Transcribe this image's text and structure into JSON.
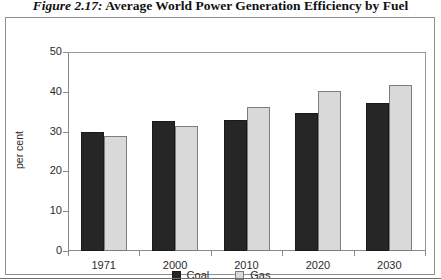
{
  "figure": {
    "number_label": "Figure 2.17:",
    "caption_text": "Average World Power Generation Efficiency by Fuel"
  },
  "chart_data": {
    "type": "bar",
    "title": "Average World Power Generation Efficiency by Fuel",
    "xlabel": "",
    "ylabel": "per cent",
    "categories": [
      "1971",
      "2000",
      "2010",
      "2020",
      "2030"
    ],
    "series": [
      {
        "name": "Coal",
        "color": "#262626",
        "values": [
          30.0,
          32.7,
          32.9,
          34.6,
          37.2
        ]
      },
      {
        "name": "Gas",
        "color": "#d9d9d9",
        "values": [
          28.8,
          31.4,
          36.2,
          40.3,
          41.7
        ]
      }
    ],
    "ylim": [
      0,
      50
    ],
    "yticks": [
      0,
      10,
      20,
      30,
      40,
      50
    ],
    "ytick_labels": [
      "0",
      "10",
      "20",
      "30",
      "40",
      "50"
    ],
    "grid": false,
    "legend_position": "bottom-center"
  },
  "legend": {
    "items": [
      {
        "label": "Coal"
      },
      {
        "label": "Gas"
      }
    ]
  }
}
